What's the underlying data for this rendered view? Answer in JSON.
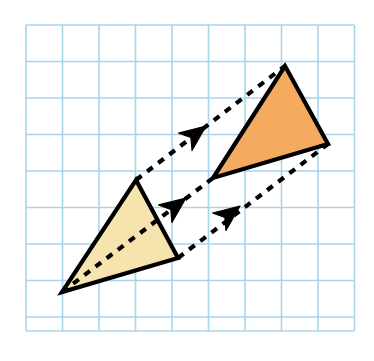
{
  "figure": {
    "kind": "translation-diagram",
    "background_color": "#ffffff"
  },
  "grid": {
    "name": "square-grid",
    "line_color": "#a9d5ec",
    "line_width": 1.6,
    "origin_x": 26,
    "origin_y": 25,
    "cell_size": 36.5,
    "columns": 9,
    "rows": 8.4,
    "width": 328,
    "height": 306
  },
  "shapes": {
    "preimage": {
      "label": "original-triangle",
      "fill_color": "#f7e3ae",
      "stroke_color": "#000000",
      "stroke_width": 4.2,
      "points": [
        {
          "x": 136,
          "y": 180
        },
        {
          "x": 178,
          "y": 258
        },
        {
          "x": 62,
          "y": 292
        }
      ]
    },
    "image": {
      "label": "translated-triangle",
      "fill_color": "#f4ab5f",
      "stroke_color": "#000000",
      "stroke_width": 4.2,
      "points": [
        {
          "x": 285,
          "y": 66
        },
        {
          "x": 328,
          "y": 144
        },
        {
          "x": 213,
          "y": 178
        }
      ]
    }
  },
  "translation": {
    "vector_x": 149,
    "vector_y": -114,
    "arrow_color": "#000000",
    "dash_pattern": "7 7",
    "dash_width": 4.2,
    "arrows": [
      {
        "name": "translation-arrow-apex",
        "from": {
          "x": 136,
          "y": 180
        },
        "to": {
          "x": 285,
          "y": 66
        },
        "head": {
          "x": 206,
          "y": 126
        }
      },
      {
        "name": "translation-arrow-bottom-left",
        "from": {
          "x": 62,
          "y": 292
        },
        "to": {
          "x": 213,
          "y": 178
        },
        "head": {
          "x": 186,
          "y": 198
        }
      },
      {
        "name": "translation-arrow-right",
        "from": {
          "x": 178,
          "y": 258
        },
        "to": {
          "x": 328,
          "y": 144
        },
        "head": {
          "x": 240,
          "y": 206
        }
      }
    ]
  }
}
